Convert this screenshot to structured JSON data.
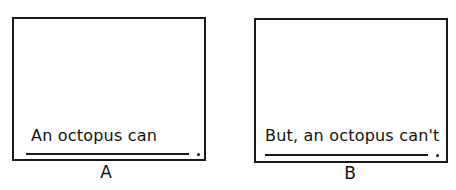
{
  "panels": [
    {
      "label": "A",
      "prompt": "An octopus  can",
      "period": "."
    },
    {
      "label": "B",
      "prompt": "But, an octopus can't",
      "period": "."
    }
  ]
}
